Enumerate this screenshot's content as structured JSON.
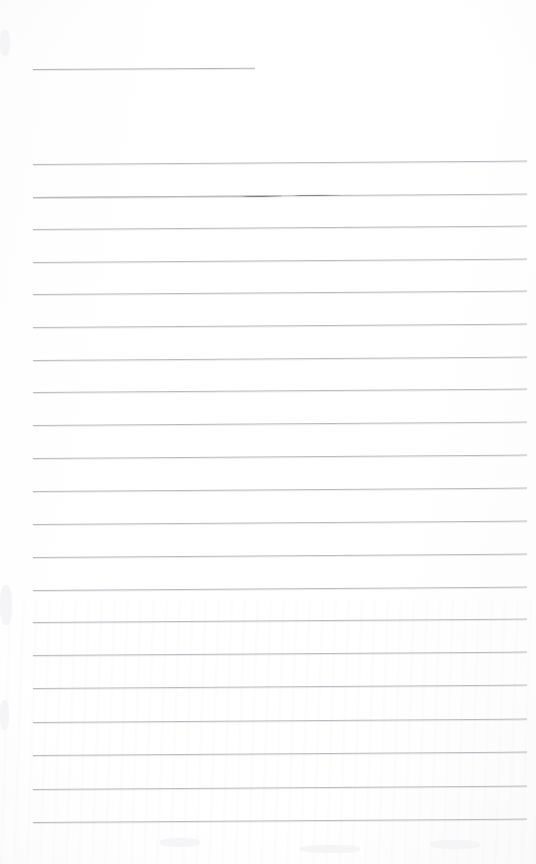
{
  "document": {
    "kind": "scanned-ruled-notebook-page",
    "title_text": "",
    "body_text": "",
    "page_width": 536,
    "page_height": 864,
    "background_color": "#fefefe",
    "rule_color": "#b9bcc2",
    "emphasis_color": "#7b7e87",
    "is_blank": true,
    "visible_text_count": 0
  },
  "title_rule": {
    "name": "title-underline",
    "x": 33,
    "y": 69,
    "width": 222,
    "slant_deg": -0.35,
    "color": "#b2b5bb"
  },
  "emphasis_marks": [
    {
      "on_rule_index": 2,
      "x": 240,
      "y": 196,
      "width": 42,
      "slant_deg": -0.35
    },
    {
      "on_rule_index": 2,
      "x": 292,
      "y": 195,
      "width": 50,
      "slant_deg": -0.35
    }
  ],
  "rules": [
    {
      "index": 0,
      "x": 33,
      "y": 164,
      "width": 494,
      "slant_deg": -0.4
    },
    {
      "index": 1,
      "x": 33,
      "y": 197,
      "width": 494,
      "slant_deg": -0.4
    },
    {
      "index": 2,
      "x": 33,
      "y": 197,
      "width": 248,
      "slant_deg": -0.4
    },
    {
      "index": 3,
      "x": 33,
      "y": 229,
      "width": 494,
      "slant_deg": -0.4
    },
    {
      "index": 4,
      "x": 33,
      "y": 262,
      "width": 494,
      "slant_deg": -0.4
    },
    {
      "index": 5,
      "x": 33,
      "y": 294,
      "width": 494,
      "slant_deg": -0.4
    },
    {
      "index": 6,
      "x": 33,
      "y": 327,
      "width": 494,
      "slant_deg": -0.4
    },
    {
      "index": 7,
      "x": 33,
      "y": 360,
      "width": 494,
      "slant_deg": -0.4
    },
    {
      "index": 8,
      "x": 33,
      "y": 392,
      "width": 494,
      "slant_deg": -0.4
    },
    {
      "index": 9,
      "x": 33,
      "y": 425,
      "width": 494,
      "slant_deg": -0.4
    },
    {
      "index": 10,
      "x": 33,
      "y": 458,
      "width": 494,
      "slant_deg": -0.4
    },
    {
      "index": 11,
      "x": 33,
      "y": 491,
      "width": 494,
      "slant_deg": -0.4
    },
    {
      "index": 12,
      "x": 33,
      "y": 524,
      "width": 494,
      "slant_deg": -0.4
    },
    {
      "index": 13,
      "x": 33,
      "y": 557,
      "width": 494,
      "slant_deg": -0.4
    },
    {
      "index": 14,
      "x": 33,
      "y": 590,
      "width": 494,
      "slant_deg": -0.4
    },
    {
      "index": 15,
      "x": 33,
      "y": 622,
      "width": 494,
      "slant_deg": -0.4
    },
    {
      "index": 16,
      "x": 33,
      "y": 655,
      "width": 494,
      "slant_deg": -0.4
    },
    {
      "index": 17,
      "x": 33,
      "y": 688,
      "width": 494,
      "slant_deg": -0.4
    },
    {
      "index": 18,
      "x": 33,
      "y": 722,
      "width": 494,
      "slant_deg": -0.4
    },
    {
      "index": 19,
      "x": 33,
      "y": 755,
      "width": 494,
      "slant_deg": -0.4
    },
    {
      "index": 20,
      "x": 33,
      "y": 789,
      "width": 494,
      "slant_deg": -0.4
    },
    {
      "index": 21,
      "x": 33,
      "y": 822,
      "width": 494,
      "slant_deg": -0.4
    }
  ],
  "edge_smudges": [
    {
      "x": 0,
      "y": 30,
      "w": 10,
      "h": 26
    },
    {
      "x": 0,
      "y": 585,
      "w": 12,
      "h": 40
    },
    {
      "x": 0,
      "y": 700,
      "w": 9,
      "h": 30
    },
    {
      "x": 160,
      "y": 838,
      "w": 40,
      "h": 9
    },
    {
      "x": 300,
      "y": 845,
      "w": 60,
      "h": 8
    },
    {
      "x": 430,
      "y": 840,
      "w": 50,
      "h": 9
    }
  ]
}
